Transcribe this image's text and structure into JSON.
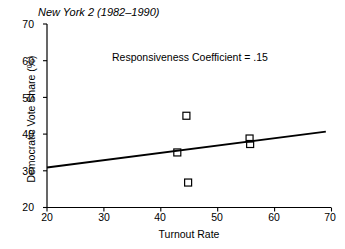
{
  "chart_data": {
    "type": "scatter",
    "title": "New York 2 (1982–1990)",
    "xlabel": "Turnout Rate",
    "ylabel": "Democratic Vote Share (%)",
    "xlim": [
      20,
      70
    ],
    "ylim": [
      20,
      70
    ],
    "xticks": [
      20,
      30,
      40,
      50,
      60,
      70
    ],
    "yticks": [
      20,
      30,
      40,
      50,
      60,
      70
    ],
    "xtick_labels": [
      "20",
      "30",
      "40",
      "50",
      "60",
      "70"
    ],
    "ytick_labels": [
      "20",
      "30",
      "40",
      "50",
      "60",
      "70"
    ],
    "grid": false,
    "legend": null,
    "annotations": [
      {
        "text": "Responsiveness Coefficient = .15",
        "x": 43,
        "y": 61
      }
    ],
    "series": [
      {
        "name": "Elections",
        "type": "scatter",
        "marker": "open-square",
        "color": "#000000",
        "points": [
          {
            "x": 44.5,
            "y": 45.0
          },
          {
            "x": 42.9,
            "y": 35.0
          },
          {
            "x": 44.8,
            "y": 26.8
          },
          {
            "x": 55.6,
            "y": 38.8
          },
          {
            "x": 55.7,
            "y": 37.3
          }
        ]
      },
      {
        "name": "Regression line",
        "type": "line",
        "color": "#000000",
        "points": [
          {
            "x": 20.0,
            "y": 30.9
          },
          {
            "x": 69.0,
            "y": 40.7
          }
        ]
      }
    ]
  },
  "axis": {
    "tick_color": "#000000",
    "line_color": "#000000"
  }
}
